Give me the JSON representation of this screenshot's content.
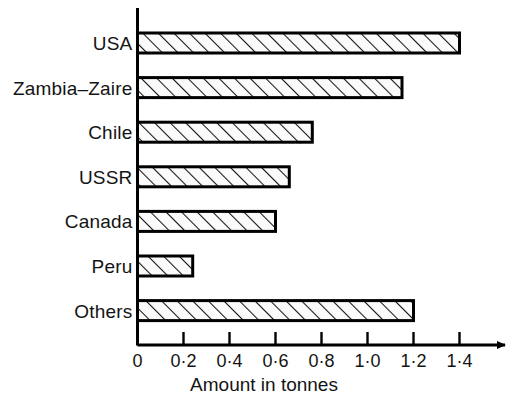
{
  "chart_data": {
    "type": "bar",
    "orientation": "horizontal",
    "title": "",
    "xlabel": "Amount in tonnes",
    "ylabel": "",
    "categories": [
      "USA",
      "Zambia–Zaire",
      "Chile",
      "USSR",
      "Canada",
      "Peru",
      "Others"
    ],
    "values": [
      1.4,
      1.15,
      0.76,
      0.66,
      0.6,
      0.24,
      1.2
    ],
    "xlim": [
      0,
      1.5
    ],
    "xticks": [
      0,
      0.2,
      0.4,
      0.6,
      0.8,
      1.0,
      1.2,
      1.4
    ],
    "xticklabels": [
      "0",
      "0·2",
      "0·4",
      "0·6",
      "0·8",
      "1·0",
      "1·2",
      "1·4"
    ],
    "grid": false,
    "legend": null,
    "bar_fill": "#ffffff",
    "bar_edge": "#000000",
    "bar_hatch": "diagonal-forward",
    "axis_color": "#000000",
    "axis_arrow_x": true,
    "background": "#ffffff"
  },
  "axis": {
    "x_title": "Amount in tonnes"
  }
}
